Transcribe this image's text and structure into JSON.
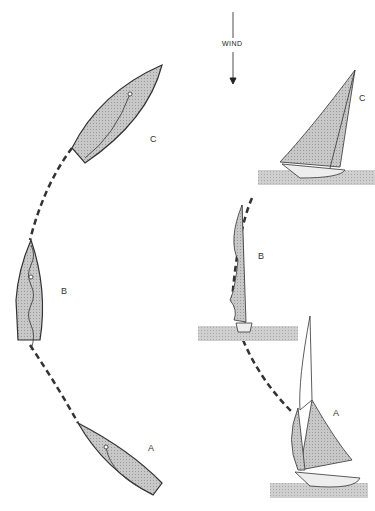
{
  "diagram": {
    "wind_label": "WIND",
    "top_view": {
      "boats": [
        {
          "label": "C",
          "position": "upper right, heading NE"
        },
        {
          "label": "B",
          "position": "left, head to wind, sail luffing"
        },
        {
          "label": "A",
          "position": "lower right, heading SE"
        }
      ]
    },
    "side_view": {
      "boats": [
        {
          "label": "C",
          "description": "heeled, sails full on new tack"
        },
        {
          "label": "B",
          "description": "upright, sails luffing head to wind"
        },
        {
          "label": "A",
          "description": "heeled, sailing close-hauled with crew"
        }
      ]
    },
    "colors": {
      "hull_fill": "#b8b8b8",
      "stroke": "#333333",
      "water": "#c4c4c4"
    }
  }
}
